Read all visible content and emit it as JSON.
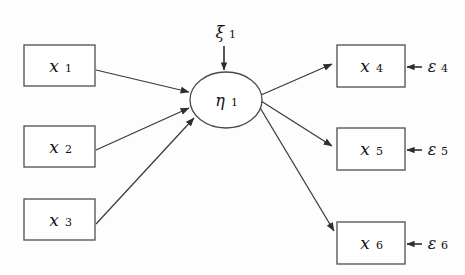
{
  "diagram": {
    "type": "path-diagram",
    "canvas": {
      "width": 465,
      "height": 275,
      "background": "#fdfdfd"
    },
    "colors": {
      "box_stroke": "#5a5a5a",
      "ellipse_stroke": "#4a4a4a",
      "arrow_stroke": "#3a3a3a",
      "text": "#111111",
      "background": "#fdfdfd"
    },
    "exogenous_indicators": [
      {
        "id": "x1",
        "base": "x",
        "subscript": "1",
        "label": "x₁",
        "x": 24,
        "y": 45,
        "w": 71,
        "h": 41
      },
      {
        "id": "x2",
        "base": "x",
        "subscript": "2",
        "label": "x₂",
        "x": 24,
        "y": 126,
        "w": 71,
        "h": 41
      },
      {
        "id": "x3",
        "base": "x",
        "subscript": "3",
        "label": "x₃",
        "x": 24,
        "y": 199,
        "w": 71,
        "h": 41
      }
    ],
    "latent_variable": {
      "id": "eta1",
      "base": "η",
      "subscript": "1",
      "label": "η₁",
      "cx": 226,
      "cy": 100,
      "rx": 36,
      "ry": 28
    },
    "disturbance": {
      "id": "xi1",
      "base": "ξ",
      "subscript": "1",
      "label": "ξ₁",
      "x": 224,
      "y": 33
    },
    "endogenous_indicators": [
      {
        "id": "x4",
        "base": "x",
        "subscript": "4",
        "label": "x₄",
        "x": 337,
        "y": 45,
        "w": 68,
        "h": 42
      },
      {
        "id": "x5",
        "base": "x",
        "subscript": "5",
        "label": "x₅",
        "x": 337,
        "y": 128,
        "w": 68,
        "h": 42
      },
      {
        "id": "x6",
        "base": "x",
        "subscript": "6",
        "label": "x₆",
        "x": 337,
        "y": 222,
        "w": 68,
        "h": 42
      }
    ],
    "error_terms": [
      {
        "id": "e4",
        "base": "ε",
        "subscript": "4",
        "label": "ε₄",
        "x": 434,
        "y": 67
      },
      {
        "id": "e5",
        "base": "ε",
        "subscript": "5",
        "label": "ε₅",
        "x": 434,
        "y": 150
      },
      {
        "id": "e6",
        "base": "ε",
        "subscript": "6",
        "label": "ε₆",
        "x": 434,
        "y": 244
      }
    ],
    "edges": [
      {
        "id": "x1-to-eta1",
        "from": "x1",
        "to": "eta1",
        "direction": "forward"
      },
      {
        "id": "x2-to-eta1",
        "from": "x2",
        "to": "eta1",
        "direction": "forward"
      },
      {
        "id": "x3-to-eta1",
        "from": "x3",
        "to": "eta1",
        "direction": "forward"
      },
      {
        "id": "xi1-to-eta1",
        "from": "xi1",
        "to": "eta1",
        "direction": "forward"
      },
      {
        "id": "eta1-to-x4",
        "from": "eta1",
        "to": "x4",
        "direction": "forward"
      },
      {
        "id": "eta1-to-x5",
        "from": "eta1",
        "to": "x5",
        "direction": "forward"
      },
      {
        "id": "eta1-to-x6",
        "from": "eta1",
        "to": "x6",
        "direction": "forward"
      },
      {
        "id": "e4-to-x4",
        "from": "e4",
        "to": "x4",
        "direction": "forward"
      },
      {
        "id": "e5-to-x5",
        "from": "e5",
        "to": "x5",
        "direction": "forward"
      },
      {
        "id": "e6-to-x6",
        "from": "e6",
        "to": "x6",
        "direction": "forward"
      }
    ]
  }
}
